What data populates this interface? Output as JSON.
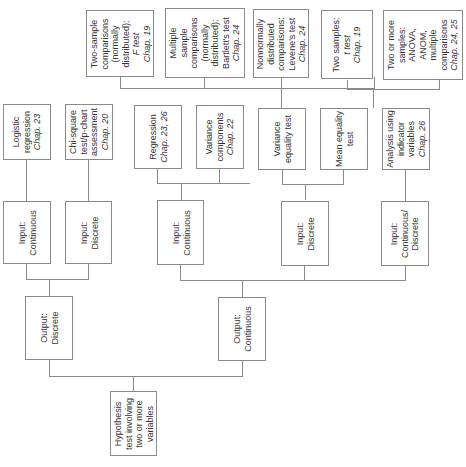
{
  "diagram": {
    "type": "hierarchical decision tree (rotated 90°, root at bottom)",
    "root": {
      "lines": [
        "Hypothesis",
        "test involving",
        "two or more",
        "variables"
      ]
    },
    "outputs": [
      {
        "lines": [
          "Output:",
          "Discrete"
        ]
      },
      {
        "lines": [
          "Output:",
          "Continuous"
        ]
      }
    ],
    "inputs": [
      {
        "lines": [
          "Input:",
          "Continuous"
        ]
      },
      {
        "lines": [
          "Input:",
          "Discrete"
        ]
      },
      {
        "lines": [
          "Input:",
          "Continuous"
        ]
      },
      {
        "lines": [
          "Input:",
          "Discrete"
        ]
      },
      {
        "lines": [
          "Input:",
          "Continuous/",
          "Discrete"
        ]
      }
    ],
    "methods": [
      {
        "lines": [
          "Logistic",
          "regression"
        ],
        "chap": "Chap. 23"
      },
      {
        "lines": [
          "Chi-square",
          "test/p-chart",
          "assessment"
        ],
        "chap": "Chap. 20"
      },
      {
        "lines": [
          "Regression"
        ],
        "chap": "Chap. 23, 26"
      },
      {
        "lines": [
          "Variance",
          "components"
        ],
        "chap": "Chap. 22"
      },
      {
        "lines": [
          "Variance",
          "equality test"
        ],
        "chap": ""
      },
      {
        "lines": [
          "Mean equality",
          "test"
        ],
        "chap": ""
      },
      {
        "lines": [
          "Analysis using",
          "indicator",
          "variables"
        ],
        "chap": "Chap. 26"
      }
    ],
    "tests": [
      {
        "lines": [
          "Two-sample",
          "comparisons",
          "(normally",
          "distributed):",
          "F test"
        ],
        "chap": "Chap. 19"
      },
      {
        "lines": [
          "Multiple",
          "sample",
          "comparisons",
          "(normally",
          "distributed):",
          "Bartlett's test"
        ],
        "chap": "Chap. 24"
      },
      {
        "lines": [
          "Nonnormally",
          "distributed",
          "comparisons:",
          "Levene's test"
        ],
        "chap": "Chap. 24"
      },
      {
        "lines": [
          "Two samples:",
          "t test"
        ],
        "chap": "Chap. 19"
      },
      {
        "lines": [
          "Two or more",
          "samples:",
          "ANOVA,",
          "ANOM,",
          "multiple",
          "comparisons"
        ],
        "chap": "Chap. 24, 25"
      }
    ]
  }
}
